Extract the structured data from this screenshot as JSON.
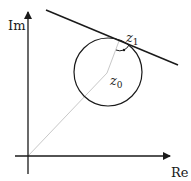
{
  "diagram": {
    "axes": {
      "imaginary_label": "Im",
      "real_label": "Re"
    },
    "points": {
      "z0": {
        "name": "z",
        "subscript": "0"
      },
      "z1": {
        "name": "z",
        "subscript": "1"
      }
    },
    "colors": {
      "stroke": "#1a1a1a",
      "radius_line": "#c8c8c8"
    }
  }
}
